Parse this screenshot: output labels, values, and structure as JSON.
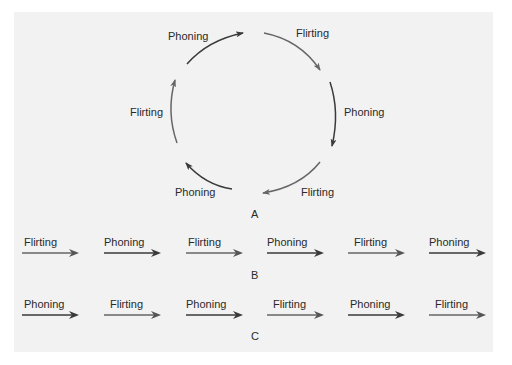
{
  "colors": {
    "background": "#ffffff",
    "panel": "#f2f2f2",
    "arrow_dark": "#3a3a3a",
    "arrow_mid": "#666666",
    "text": "#2a2a2a"
  },
  "cycle_a": {
    "letter": "A",
    "arcs": [
      {
        "label": "Phoning",
        "position": "top-left"
      },
      {
        "label": "Flirting",
        "position": "top-right"
      },
      {
        "label": "Phoning",
        "position": "right"
      },
      {
        "label": "Flirting",
        "position": "bottom-right"
      },
      {
        "label": "Phoning",
        "position": "bottom-left"
      },
      {
        "label": "Flirting",
        "position": "left"
      }
    ]
  },
  "sequence_b": {
    "letter": "B",
    "items": [
      {
        "label": "Flirting"
      },
      {
        "label": "Phoning"
      },
      {
        "label": "Flirting"
      },
      {
        "label": "Phoning"
      },
      {
        "label": "Flirting"
      },
      {
        "label": "Phoning"
      }
    ]
  },
  "sequence_c": {
    "letter": "C",
    "items": [
      {
        "label": "Phoning"
      },
      {
        "label": "Flirting"
      },
      {
        "label": "Phoning"
      },
      {
        "label": "Flirting"
      },
      {
        "label": "Phoning"
      },
      {
        "label": "Flirting"
      }
    ]
  }
}
